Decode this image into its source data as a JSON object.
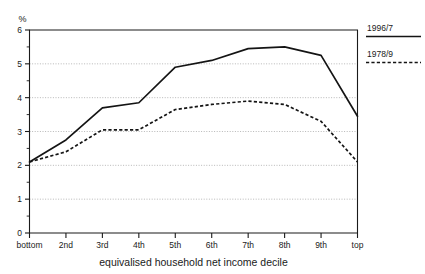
{
  "chart_data": {
    "type": "line",
    "title": "",
    "subtitle": "",
    "xlabel": "equivalised household net income decile",
    "ylabel": "%",
    "categories": [
      "bottom",
      "2nd",
      "3rd",
      "4th",
      "5th",
      "6th",
      "7th",
      "8th",
      "9th",
      "top"
    ],
    "ylim": [
      0,
      6
    ],
    "yticks": [
      0,
      1,
      2,
      3,
      4,
      5,
      6
    ],
    "ytick_labels": [
      "0",
      "1",
      "2",
      "3",
      "4",
      "5",
      "6"
    ],
    "y_minor_ticks": [
      0.5,
      1.5,
      2.5,
      3.5,
      4.5,
      5.5
    ],
    "grid": "horizontal-dotted",
    "legend_position": "right-outside",
    "series": [
      {
        "name": "1996/7",
        "style": "solid",
        "color": "#141414",
        "values": [
          2.1,
          2.75,
          3.7,
          3.85,
          4.9,
          5.1,
          5.45,
          5.5,
          5.25,
          3.45
        ]
      },
      {
        "name": "1978/9",
        "style": "dashed",
        "color": "#141414",
        "values": [
          2.1,
          2.4,
          3.05,
          3.05,
          3.65,
          3.8,
          3.9,
          3.8,
          3.3,
          2.1
        ]
      }
    ]
  },
  "legend": {
    "items": [
      {
        "label": "1996/7",
        "style": "solid"
      },
      {
        "label": "1978/9",
        "style": "dashed"
      }
    ]
  },
  "axes": {
    "y_unit_label": "%",
    "x_axis_title": "equivalised household net income decile"
  }
}
